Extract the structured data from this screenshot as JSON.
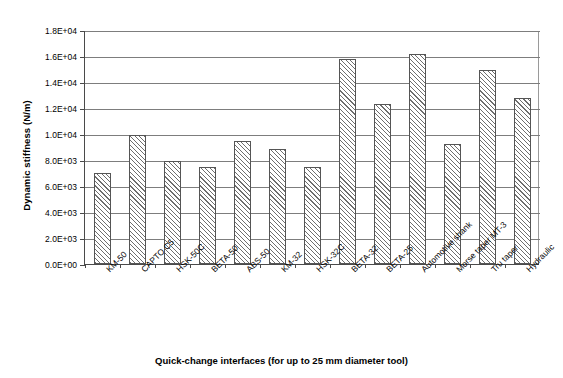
{
  "chart_data": {
    "type": "bar",
    "title": "",
    "xlabel": "Quick-change interfaces (for up to 25 mm diameter tool)",
    "ylabel": "Dynamic stiffness (N/m)",
    "categories": [
      "KM-50",
      "CAPTO C5",
      "HSK-50C",
      "BETA-50",
      "ABS-50",
      "KM-32",
      "HSK-32C",
      "BETA-32",
      "BETA-25",
      "Automotive shank",
      "Morse taper MT-3",
      "Tru taper",
      "Hydraulic"
    ],
    "values": [
      7000,
      9900,
      7950,
      7500,
      9450,
      8850,
      7500,
      15800,
      12300,
      16150,
      9200,
      14950,
      12750
    ],
    "ylim": [
      0,
      18000
    ],
    "ytick_values": [
      0,
      2000,
      4000,
      6000,
      8000,
      10000,
      12000,
      14000,
      16000,
      18000
    ],
    "ytick_labels": [
      "0.0E+00",
      "2.0E+03",
      "4.0E+03",
      "6.0E+03",
      "8.0E+03",
      "1.0E+04",
      "1.2E+04",
      "1.4E+04",
      "1.6E+04",
      "1.8E+04"
    ],
    "grid": true,
    "legend": "none",
    "bar_fill": "diagonal-hatch",
    "bar_edge_color": "#555555",
    "grid_color": "#7d7d7d",
    "axis_color": "#4a4a4a"
  }
}
